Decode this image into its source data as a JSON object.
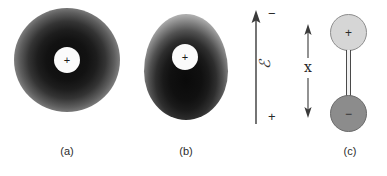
{
  "figure": {
    "background_color": "#ffffff",
    "width": 387,
    "height": 176
  },
  "panels": [
    {
      "id": "a",
      "caption": "(a)",
      "title": "unpolarized atom",
      "nucleus_charge": "+",
      "cloud_shape": "circle",
      "cloud_center_offset": "symmetric",
      "cloud_color_dark": "#0c0c0c",
      "cloud_color_light": "#ffffff",
      "nucleus_color": "#fbfbfb"
    },
    {
      "id": "b",
      "caption": "(b)",
      "title": "polarized atom in field",
      "nucleus_charge": "+",
      "cloud_shape": "ovoid",
      "cloud_center_offset": "nucleus displaced upward",
      "cloud_color_dark": "#0a0a0a",
      "cloud_color_light": "#ffffff",
      "nucleus_color": "#fbfbfb"
    },
    {
      "id": "c",
      "caption": "(c)",
      "title": "equivalent dipole",
      "positive_charge_label": "+",
      "negative_charge_label": "−",
      "positive_color": "#d6d6d6",
      "negative_color": "#8c8c8c",
      "separation_label": "x"
    }
  ],
  "field_arrow": {
    "symbol": "ℰ",
    "top_sign": "−",
    "bottom_sign": "+",
    "direction": "up",
    "color": "#333333"
  }
}
